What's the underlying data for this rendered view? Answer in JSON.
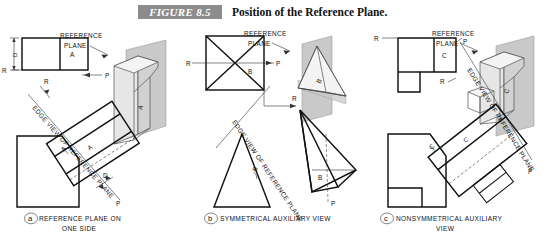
{
  "header": {
    "figure_badge": "FIGURE 8.5",
    "title": "Position of the Reference Plane.",
    "badge_color": "#8c8c8c",
    "badge_text_color": "#ffffff"
  },
  "figure": {
    "reference_plane_label_line1": "REFERENCE",
    "reference_plane_label_line2": "PLANE",
    "edge_view_label": "EDGE VIEW OF REFERENCE PLANE",
    "plane_fill_color": "#c9c9c9",
    "outline_color": "#111111"
  },
  "panels": [
    {
      "id": "a",
      "letter": "a",
      "caption_line1": "REFERENCE PLANE ON",
      "caption_line2": "ONE SIDE",
      "object_label": "A",
      "ref_label": "R",
      "plane_label": "P",
      "depth_label": "D",
      "top_view": "two-rectangle top view",
      "front_view": "chamfered rectangle",
      "aux_view": "inclined auxiliary view",
      "pictorial": "wedge block with reference plane behind"
    },
    {
      "id": "b",
      "letter": "b",
      "caption_line1": "SYMMETRICAL AUXILIARY VIEW",
      "caption_line2": "",
      "object_label": "B",
      "ref_label": "R",
      "plane_label": "P",
      "depth_label": "",
      "top_view": "square with X diagonals",
      "front_view": "isoceles triangle",
      "aux_view": "inclined pyramid auxiliary view",
      "pictorial": "pyramid with reference plane through center"
    },
    {
      "id": "c",
      "letter": "c",
      "caption_line1": "NONSYMMETRICAL AUXILIARY",
      "caption_line2": "VIEW",
      "object_label": "C",
      "ref_label": "R",
      "plane_label": "P",
      "depth_label": "",
      "top_view": "L-shaped top view",
      "front_view": "chamfered block with notch",
      "aux_view": "inclined auxiliary view with boss",
      "pictorial": "inclined-face block with boss and reference plane"
    }
  ]
}
